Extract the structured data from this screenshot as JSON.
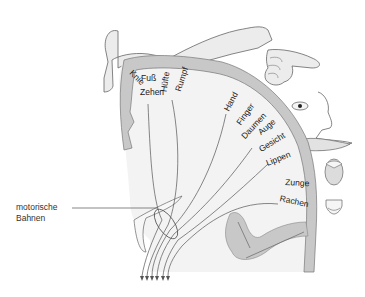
{
  "diagram": {
    "colors": {
      "cortex_gray": "#c8c8c8",
      "white_matter": "#f3f3f3",
      "outline": "#555555",
      "body_fill": "#e6e6e6",
      "text": "#1a1a1a"
    },
    "cortex_labels": [
      {
        "id": "knie",
        "text": "Knie",
        "x": 130,
        "y": 77,
        "rot": 45
      },
      {
        "id": "fuss",
        "text": "Fuß",
        "x": 141,
        "y": 82,
        "rot": 0
      },
      {
        "id": "zehen",
        "text": "Zehen",
        "x": 140,
        "y": 96,
        "rot": 0
      },
      {
        "id": "huefte",
        "text": "Hüfte",
        "x": 164,
        "y": 88,
        "rot": -80
      },
      {
        "id": "rumpf",
        "text": "Rumpf",
        "x": 180,
        "y": 90,
        "rot": -72
      },
      {
        "id": "hand",
        "text": "Hand",
        "x": 231,
        "y": 110,
        "rot": -62
      },
      {
        "id": "finger",
        "text": "Finger",
        "x": 243,
        "y": 124,
        "rot": -55
      },
      {
        "id": "daumen",
        "text": "Daumen",
        "x": 247,
        "y": 138,
        "rot": -47
      },
      {
        "id": "auge",
        "text": "Auge",
        "x": 262,
        "y": 134,
        "rot": -40
      },
      {
        "id": "gesicht",
        "text": "Gesicht",
        "x": 262,
        "y": 149,
        "rot": -32
      },
      {
        "id": "lippen",
        "text": "Lippen",
        "x": 270,
        "y": 162,
        "rot": -22
      },
      {
        "id": "zunge",
        "text": "Zunge",
        "x": 286,
        "y": 187,
        "rot": 3
      },
      {
        "id": "rachen",
        "text": "Rachen",
        "x": 280,
        "y": 203,
        "rot": 12
      }
    ],
    "callout": {
      "line1": "motorische",
      "line2": "Bahnen"
    }
  }
}
